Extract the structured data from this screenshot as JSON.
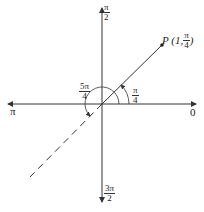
{
  "diagram": {
    "axis_labels": {
      "right": "0",
      "top": {
        "num": "π",
        "den": "2"
      },
      "left": "π",
      "bottom": {
        "num": "3π",
        "den": "2"
      }
    },
    "point": {
      "label_prefix": "P (1, ",
      "angle": {
        "num": "π",
        "den": "4"
      },
      "label_suffix": ")"
    },
    "angles": [
      {
        "num": "π",
        "den": "4"
      },
      {
        "num": "5π",
        "den": "4"
      }
    ],
    "colors": {
      "stroke": "#333333",
      "background": "#ffffff"
    }
  }
}
